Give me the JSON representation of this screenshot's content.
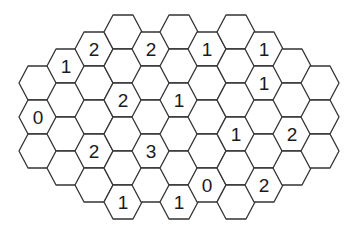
{
  "puzzle": {
    "type": "hexagonal-minesweeper",
    "stroke_color": "#333333",
    "fill_color": "#ffffff",
    "text_color": "#1a1a1a",
    "columns": [
      {
        "col": 0,
        "cx": 38,
        "cells": [
          {
            "top": 66,
            "value": ""
          },
          {
            "top": 100,
            "value": "0"
          },
          {
            "top": 134,
            "value": ""
          }
        ]
      },
      {
        "col": 1,
        "cx": 66,
        "cells": [
          {
            "top": 49,
            "value": "1"
          },
          {
            "top": 83,
            "value": ""
          },
          {
            "top": 117,
            "value": ""
          },
          {
            "top": 151,
            "value": ""
          }
        ]
      },
      {
        "col": 2,
        "cx": 94,
        "cells": [
          {
            "top": 32,
            "value": "2"
          },
          {
            "top": 66,
            "value": ""
          },
          {
            "top": 100,
            "value": ""
          },
          {
            "top": 134,
            "value": "2"
          },
          {
            "top": 168,
            "value": ""
          }
        ]
      },
      {
        "col": 3,
        "cx": 123,
        "cells": [
          {
            "top": 15,
            "value": ""
          },
          {
            "top": 49,
            "value": ""
          },
          {
            "top": 83,
            "value": "2"
          },
          {
            "top": 117,
            "value": ""
          },
          {
            "top": 151,
            "value": ""
          },
          {
            "top": 185,
            "value": "1"
          }
        ]
      },
      {
        "col": 4,
        "cx": 151,
        "cells": [
          {
            "top": 32,
            "value": "2"
          },
          {
            "top": 66,
            "value": ""
          },
          {
            "top": 100,
            "value": ""
          },
          {
            "top": 134,
            "value": "3"
          },
          {
            "top": 168,
            "value": ""
          }
        ]
      },
      {
        "col": 5,
        "cx": 179,
        "cells": [
          {
            "top": 15,
            "value": ""
          },
          {
            "top": 49,
            "value": ""
          },
          {
            "top": 83,
            "value": "1"
          },
          {
            "top": 117,
            "value": ""
          },
          {
            "top": 151,
            "value": ""
          },
          {
            "top": 185,
            "value": "1"
          }
        ]
      },
      {
        "col": 6,
        "cx": 207,
        "cells": [
          {
            "top": 32,
            "value": "1"
          },
          {
            "top": 66,
            "value": ""
          },
          {
            "top": 100,
            "value": ""
          },
          {
            "top": 134,
            "value": ""
          },
          {
            "top": 168,
            "value": "0"
          }
        ]
      },
      {
        "col": 7,
        "cx": 236,
        "cells": [
          {
            "top": 15,
            "value": ""
          },
          {
            "top": 49,
            "value": ""
          },
          {
            "top": 83,
            "value": ""
          },
          {
            "top": 117,
            "value": "1"
          },
          {
            "top": 151,
            "value": ""
          },
          {
            "top": 185,
            "value": ""
          }
        ]
      },
      {
        "col": 8,
        "cx": 264,
        "cells": [
          {
            "top": 32,
            "value": "1"
          },
          {
            "top": 66,
            "value": "1"
          },
          {
            "top": 100,
            "value": ""
          },
          {
            "top": 134,
            "value": ""
          },
          {
            "top": 168,
            "value": "2"
          }
        ]
      },
      {
        "col": 9,
        "cx": 292,
        "cells": [
          {
            "top": 49,
            "value": ""
          },
          {
            "top": 83,
            "value": ""
          },
          {
            "top": 117,
            "value": "2"
          },
          {
            "top": 151,
            "value": ""
          }
        ]
      },
      {
        "col": 10,
        "cx": 320,
        "cells": [
          {
            "top": 66,
            "value": ""
          },
          {
            "top": 100,
            "value": ""
          },
          {
            "top": 134,
            "value": ""
          }
        ]
      }
    ]
  }
}
